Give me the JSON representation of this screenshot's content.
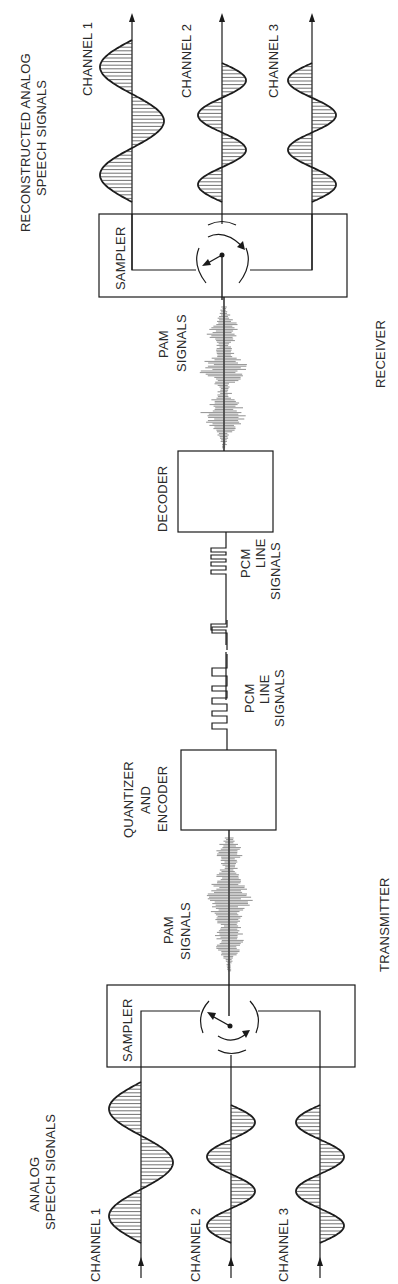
{
  "diagram": {
    "title_receiver": [
      "RECONSTRUCTED ANALOG",
      "SPEECH SIGNALS"
    ],
    "title_transmitter": [
      "ANALOG",
      "SPEECH SIGNALS"
    ],
    "receiver_label": "RECEIVER",
    "transmitter_label": "TRANSMITTER",
    "blocks": {
      "sampler_rx": "SAMPLER",
      "decoder": "DECODER",
      "quantizer": [
        "QUANTIZER",
        "AND",
        "ENCODER"
      ],
      "sampler_tx": "SAMPLER"
    },
    "signals": {
      "pam_rx": [
        "PAM",
        "SIGNALS"
      ],
      "pcm_rx": [
        "PCM",
        "LINE",
        "SIGNALS"
      ],
      "pcm_tx": [
        "PCM",
        "LINE",
        "SIGNALS"
      ],
      "pam_tx": [
        "PAM",
        "SIGNALS"
      ]
    },
    "channels_rx": [
      {
        "label": "CHANNEL 1",
        "cycles": 1.5
      },
      {
        "label": "CHANNEL 2",
        "cycles": 2
      },
      {
        "label": "CHANNEL 3",
        "cycles": 2
      }
    ],
    "channels_tx": [
      {
        "label": "CHANNEL 1",
        "cycles": 1.5
      },
      {
        "label": "CHANNEL 2",
        "cycles": 2
      },
      {
        "label": "CHANNEL 3",
        "cycles": 2
      }
    ]
  }
}
